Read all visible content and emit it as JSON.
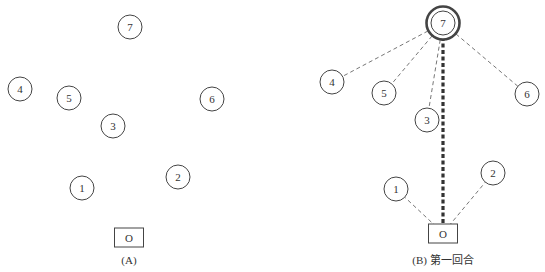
{
  "panels": [
    {
      "id": "A",
      "caption": "(A)",
      "origin": {
        "label": "O",
        "x": 129,
        "y": 237
      },
      "nodes": [
        {
          "label": "7",
          "x": 130,
          "y": 27
        },
        {
          "label": "4",
          "x": 20,
          "y": 89
        },
        {
          "label": "5",
          "x": 69,
          "y": 98
        },
        {
          "label": "6",
          "x": 212,
          "y": 99
        },
        {
          "label": "3",
          "x": 113,
          "y": 126
        },
        {
          "label": "1",
          "x": 82,
          "y": 188
        },
        {
          "label": "2",
          "x": 178,
          "y": 177
        }
      ]
    },
    {
      "id": "B",
      "caption": "(B) 第一回合",
      "origin": {
        "label": "O",
        "x": 443,
        "y": 233
      },
      "selected_node": "7",
      "nodes": [
        {
          "label": "7",
          "x": 443,
          "y": 23
        },
        {
          "label": "4",
          "x": 332,
          "y": 82
        },
        {
          "label": "5",
          "x": 384,
          "y": 93
        },
        {
          "label": "6",
          "x": 527,
          "y": 94
        },
        {
          "label": "3",
          "x": 427,
          "y": 120
        },
        {
          "label": "1",
          "x": 396,
          "y": 189
        },
        {
          "label": "2",
          "x": 493,
          "y": 173
        }
      ],
      "dashed_edges": [
        [
          "7",
          "4"
        ],
        [
          "7",
          "5"
        ],
        [
          "7",
          "3"
        ],
        [
          "7",
          "6"
        ],
        [
          "O",
          "1"
        ],
        [
          "O",
          "2"
        ]
      ],
      "bold_edge": [
        "O",
        "7"
      ]
    }
  ],
  "style": {
    "stroke": "#444444",
    "bold_stroke": "#333333",
    "dashed_stroke": "#666666"
  }
}
